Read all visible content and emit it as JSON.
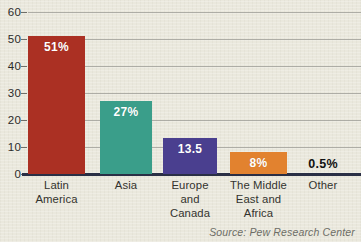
{
  "chart_data": {
    "type": "bar",
    "title": "",
    "subtitle": "",
    "xlabel": "",
    "ylabel": "",
    "ylim": [
      0,
      60
    ],
    "yticks": [
      0,
      10,
      20,
      30,
      40,
      50,
      60
    ],
    "grid": true,
    "legend": "none",
    "categories": [
      "Latin\nAmerica",
      "Asia",
      "Europe\nand\nCanada",
      "The Middle\nEast and\nAfrica",
      "Other"
    ],
    "category_lines": [
      [
        "Latin",
        "America"
      ],
      [
        "Asia"
      ],
      [
        "Europe",
        "and",
        "Canada"
      ],
      [
        "The Middle",
        "East and",
        "Africa"
      ],
      [
        "Other"
      ]
    ],
    "values": [
      51,
      27,
      13.5,
      8,
      0.5
    ],
    "data_labels": [
      "51%",
      "27%",
      "13.5",
      "8%",
      "0.5%"
    ],
    "colors": [
      "#ab3023",
      "#3a9e8a",
      "#4a3f8f",
      "#e2822f",
      "#eae8dd"
    ],
    "label_placement": [
      "inside",
      "inside",
      "inside",
      "inside",
      "outside"
    ],
    "source": "Source: Pew Research Center"
  },
  "axis": {
    "tick_labels": [
      "60",
      "50",
      "40",
      "30",
      "20",
      "10",
      "0"
    ]
  },
  "colors": {
    "background": "#eae8dd",
    "baseline": "#2a2f45",
    "gridline": "#9a9a93",
    "tick_text": "#2b2b2b",
    "category_text": "#33332e",
    "source_text": "#6d6d66"
  }
}
